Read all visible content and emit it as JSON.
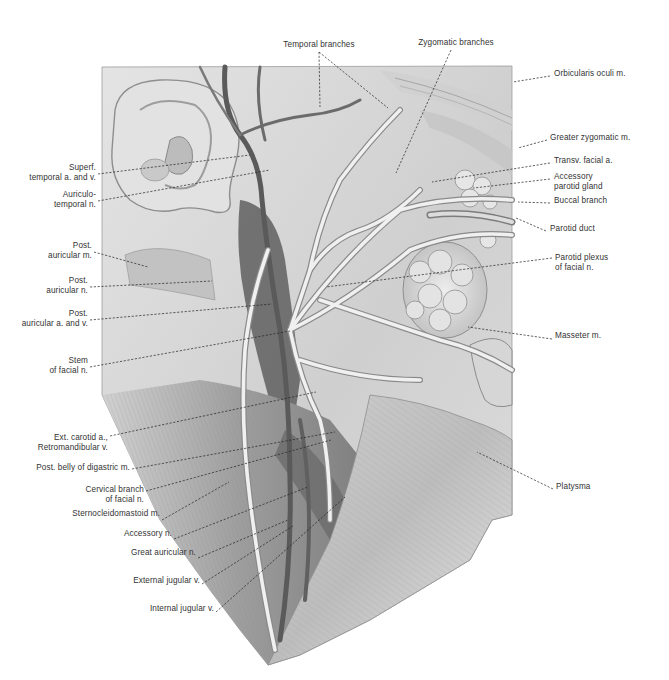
{
  "figure": {
    "palette": {
      "background": "#ffffff",
      "skin_light": "#d9d9d9",
      "muscle_mid": "#a8a8a8",
      "vessel_dark": "#5a5a5a",
      "nerve_light": "#ececec",
      "label_text": "#333333"
    }
  },
  "labels_left": [
    {
      "id": "superf-temporal",
      "text": "Superf.\ntemporal a. and v.",
      "x": 96,
      "y": 168,
      "tip": [
        250,
        155
      ]
    },
    {
      "id": "auriculotemporal",
      "text": "Auriculo-\ntemporal n.",
      "x": 96,
      "y": 195,
      "tip": [
        270,
        170
      ]
    },
    {
      "id": "post-auricular-m",
      "text": "Post.\nauricular m.",
      "x": 92,
      "y": 246,
      "tip": [
        148,
        267
      ]
    },
    {
      "id": "post-auricular-n",
      "text": "Post.\nauricular n.",
      "x": 88,
      "y": 281,
      "tip": [
        212,
        281
      ]
    },
    {
      "id": "post-auricular-av",
      "text": "Post.\nauricular a. and v.",
      "x": 88,
      "y": 314,
      "tip": [
        272,
        304
      ]
    },
    {
      "id": "stem-facial",
      "text": "Stem\nof facial n.",
      "x": 88,
      "y": 361,
      "tip": [
        290,
        331
      ]
    },
    {
      "id": "ext-carotid",
      "text": "Ext. carotid a.,\nRetromandibular v.",
      "x": 108,
      "y": 430,
      "tip": [
        316,
        392
      ]
    },
    {
      "id": "post-belly-digastric",
      "text": "Post. belly of digastric m.",
      "x": 130,
      "y": 463,
      "tip": [
        335,
        432
      ]
    },
    {
      "id": "cervical-branch",
      "text": "Cervical branch\nof facial n.",
      "x": 144,
      "y": 485,
      "tip": [
        331,
        440
      ]
    },
    {
      "id": "sternocleidomastoid",
      "text": "Sternocleidomastoid m.",
      "x": 160,
      "y": 514,
      "tip": [
        229,
        482
      ]
    },
    {
      "id": "accessory-n",
      "text": "Accessory n.",
      "x": 172,
      "y": 533,
      "tip": [
        308,
        487
      ]
    },
    {
      "id": "great-auricular",
      "text": "Great auricular n.",
      "x": 196,
      "y": 552,
      "tip": [
        288,
        520
      ]
    },
    {
      "id": "external-jugular",
      "text": "External jugular v.",
      "x": 200,
      "y": 578,
      "tip": [
        293,
        526
      ]
    },
    {
      "id": "internal-jugular",
      "text": "Internal jugular v.",
      "x": 214,
      "y": 606,
      "tip": [
        345,
        497
      ]
    }
  ],
  "labels_top": [
    {
      "id": "temporal-branches",
      "text": "Temporal branches",
      "x": 319,
      "y": 42,
      "tip": [
        320,
        107
      ],
      "tip2": [
        388,
        108
      ]
    },
    {
      "id": "zygomatic-branches",
      "text": "Zygomatic branches",
      "x": 451,
      "y": 40,
      "tip": [
        396,
        173
      ]
    }
  ],
  "labels_right": [
    {
      "id": "orbicularis-oculi",
      "text": "Orbicularis oculi m.",
      "x": 553,
      "y": 71,
      "tip": [
        513,
        82
      ]
    },
    {
      "id": "greater-zygomatic",
      "text": "Greater zygomatic m.",
      "x": 550,
      "y": 135,
      "tip": [
        518,
        148
      ]
    },
    {
      "id": "transv-facial",
      "text": "Transv. facial a.",
      "x": 553,
      "y": 158,
      "tip": [
        432,
        182
      ]
    },
    {
      "id": "accessory-parotid",
      "text": "Accessory\nparotid gland",
      "x": 553,
      "y": 174,
      "tip": [
        474,
        188
      ]
    },
    {
      "id": "buccal-branch",
      "text": "Buccal branch",
      "x": 553,
      "y": 198,
      "tip": [
        518,
        202
      ]
    },
    {
      "id": "parotid-duct",
      "text": "Parotid duct",
      "x": 549,
      "y": 226,
      "tip": [
        516,
        218
      ]
    },
    {
      "id": "parotid-plexus",
      "text": "Parotid plexus\nof facial n.",
      "x": 555,
      "y": 253,
      "tip": [
        326,
        287
      ]
    },
    {
      "id": "masseter",
      "text": "Masseter m.",
      "x": 555,
      "y": 334,
      "tip": [
        468,
        327
      ]
    },
    {
      "id": "platysma",
      "text": "Platysma",
      "x": 556,
      "y": 484,
      "tip": [
        477,
        452
      ]
    }
  ]
}
